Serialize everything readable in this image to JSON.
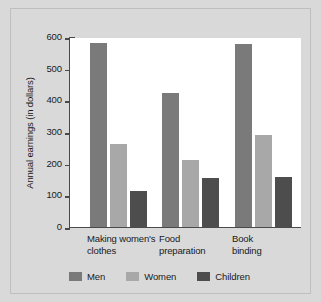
{
  "chart_data": {
    "type": "bar",
    "title": "",
    "xlabel": "",
    "ylabel": "Annual earnings (in dollars)",
    "ylim": [
      0,
      600
    ],
    "ytick_step": 100,
    "yticks": [
      0,
      100,
      200,
      300,
      400,
      500,
      600
    ],
    "ytick_labels": [
      "0",
      "100",
      "200",
      "300",
      "400",
      "500",
      "600"
    ],
    "grid": false,
    "legend_position": "bottom",
    "categories": [
      "Making women's\nclothes",
      "Food\npreparation",
      "Book\nbinding"
    ],
    "series": [
      {
        "name": "Men",
        "color": "#7a7a7a",
        "values": [
          580,
          423,
          578
        ]
      },
      {
        "name": "Women",
        "color": "#a8a8a8",
        "values": [
          262,
          212,
          292
        ]
      },
      {
        "name": "Children",
        "color": "#4d4d4d",
        "values": [
          115,
          155,
          158
        ]
      }
    ]
  },
  "axis": {
    "y_title": "Annual earnings (in dollars)",
    "y_tick_labels": [
      "600",
      "500",
      "400",
      "300",
      "200",
      "100",
      "0"
    ]
  },
  "categories": [
    {
      "label": "Making women's\nclothes"
    },
    {
      "label": "Food\npreparation"
    },
    {
      "label": "Book\nbinding"
    }
  ],
  "legend": {
    "items": [
      {
        "label": "Men",
        "color": "#7a7a7a"
      },
      {
        "label": "Women",
        "color": "#a8a8a8"
      },
      {
        "label": "Children",
        "color": "#4d4d4d"
      }
    ]
  },
  "colors": {
    "background": "#d9d9d9",
    "plot_background": "#ffffff",
    "axis": "#4a4a4a",
    "text": "#1a1a1a",
    "men": "#7a7a7a",
    "women": "#a8a8a8",
    "children": "#4d4d4d"
  }
}
